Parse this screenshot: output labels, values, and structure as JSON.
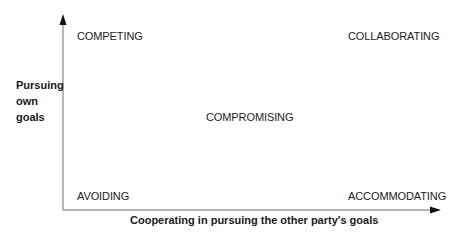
{
  "diagram": {
    "type": "conflict-handling-modes-grid",
    "y_axis": {
      "label_lines": [
        "Pursuing",
        "own",
        "goals"
      ]
    },
    "x_axis": {
      "label": "Cooperating in pursuing the other party's goals"
    },
    "quadrants": {
      "top_left": "COMPETING",
      "top_right": "COLLABORATING",
      "center": "COMPROMISING",
      "bottom_left": "AVOIDING",
      "bottom_right": "ACCOMMODATING"
    },
    "colors": {
      "axis": "#6e6e6e",
      "arrowhead": "#111111",
      "text": "#1a1a1a",
      "background": "#ffffff"
    }
  }
}
